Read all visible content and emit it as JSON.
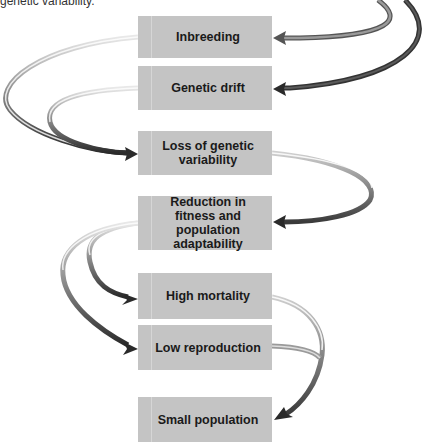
{
  "caption": "genetic variability.",
  "boxes": {
    "inbreeding": "Inbreeding",
    "genetic_drift": "Genetic drift",
    "loss": "Loss of genetic variability",
    "reduction": "Reduction in fitness and population adaptability",
    "high_mortality": "High mortality",
    "low_reproduction": "Low reproduction",
    "small_population": "Small population"
  },
  "arrows": [
    {
      "from": "small_population",
      "to": "inbreeding"
    },
    {
      "from": "small_population",
      "to": "genetic_drift"
    },
    {
      "from": "inbreeding",
      "to": "loss"
    },
    {
      "from": "genetic_drift",
      "to": "loss"
    },
    {
      "from": "loss",
      "to": "reduction"
    },
    {
      "from": "reduction",
      "to": "high_mortality"
    },
    {
      "from": "reduction",
      "to": "low_reproduction"
    },
    {
      "from": "high_mortality",
      "to": "small_population"
    },
    {
      "from": "low_reproduction",
      "to": "small_population"
    }
  ]
}
